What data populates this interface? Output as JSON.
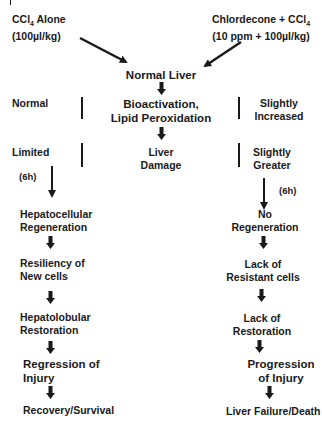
{
  "left_input": {
    "line1": "CCl",
    "sub": "4",
    "line1b": " Alone",
    "line2": "(100µl/kg)"
  },
  "right_input": {
    "line1": "Chlordecone + CCl",
    "sub": "4",
    "line2": "(10 ppm + 100µl/kg)"
  },
  "center": {
    "normal_liver": "Normal Liver",
    "bioactivation_1": "Bioactivation,",
    "bioactivation_2": "Lipid Peroxidation",
    "damage_1": "Liver",
    "damage_2": "Damage"
  },
  "left_side": {
    "bioactivation_level": "Normal",
    "damage_level": "Limited",
    "time_label": "(6h)",
    "steps": [
      [
        "Hepatocellular",
        "Regeneration"
      ],
      [
        "Resiliency of",
        "New cells"
      ],
      [
        "Hepatolobular",
        "Restoration"
      ],
      [
        "Regression of",
        "Injury"
      ],
      [
        "Recovery/Survival"
      ]
    ]
  },
  "right_side": {
    "bioactivation_level": [
      "Slightly",
      "Increased"
    ],
    "damage_level": [
      "Slightly",
      "Greater"
    ],
    "time_label": "(6h)",
    "steps": [
      [
        "No",
        "Regeneration"
      ],
      [
        "Lack of",
        "Resistant cells"
      ],
      [
        "Lack of",
        "Restoration"
      ],
      [
        "Progression",
        "of Injury"
      ],
      [
        "Liver Failure/Death"
      ]
    ]
  }
}
